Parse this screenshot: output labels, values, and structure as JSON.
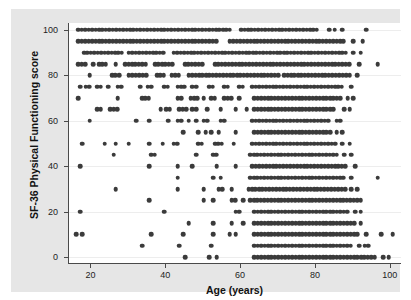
{
  "chart_data": {
    "type": "scatter",
    "title": "",
    "subtitle": "",
    "xlabel": "Age (years)",
    "ylabel": "SF-36 Physical Functioning score",
    "xlim": [
      14,
      103
    ],
    "ylim": [
      -3,
      103
    ],
    "xticks": [
      20,
      40,
      60,
      80,
      100
    ],
    "yticks": [
      0,
      20,
      40,
      60,
      80,
      100
    ],
    "xtick_labels": [
      "20",
      "40",
      "60",
      "80",
      "100"
    ],
    "ytick_labels": [
      "0",
      "20",
      "40",
      "60",
      "80",
      "100"
    ],
    "grid": "horizontal-faint",
    "legend": "none",
    "marker": {
      "shape": "circle",
      "color": "#3b3b3b",
      "size_px": 4.6
    },
    "panel_background": "#ffffff",
    "figure_background": "#e6e6e6",
    "axis_color": "#4a4a4a",
    "series": [
      {
        "name": "participants",
        "score_step": 5,
        "bands": [
          {
            "score": 100,
            "runs": [
              [
                16.5,
                57.5
              ],
              [
                60.0,
                80.5
              ]
            ],
            "singles": [
              83.5,
              85.0,
              87.0,
              93.5
            ]
          },
          {
            "score": 95,
            "runs": [
              [
                16.5,
                54.0
              ],
              [
                57.0,
                88.0
              ]
            ],
            "singles": [
              90.0,
              92.5
            ]
          },
          {
            "score": 90,
            "runs": [
              [
                18.0,
                28.5
              ],
              [
                30.0,
                40.0
              ],
              [
                42.0,
                88.0
              ]
            ],
            "singles": [
              90.0,
              92.0
            ]
          },
          {
            "score": 85,
            "runs": [
              [
                16.5,
                19.0
              ],
              [
                22.0,
                24.5
              ],
              [
                29.0,
                35.0
              ],
              [
                37.0,
                42.0
              ],
              [
                45.0,
                50.5
              ],
              [
                53.0,
                89.5
              ]
            ],
            "singles": [
              20.5,
              26.5,
              91.5,
              96.5
            ]
          },
          {
            "score": 80,
            "runs": [
              [
                25.5,
                28.0
              ],
              [
                30.0,
                35.5
              ],
              [
                37.5,
                39.5
              ],
              [
                41.5,
                43.5
              ],
              [
                46.0,
                70.0
              ],
              [
                71.5,
                89.0
              ]
            ],
            "singles": [
              19.5,
              91.0
            ]
          },
          {
            "score": 75,
            "runs": [
              [
                18.5,
                19.5
              ],
              [
                21.5,
                22.5
              ],
              [
                27.0,
                28.0
              ],
              [
                35.0,
                36.5
              ],
              [
                39.5,
                41.0
              ],
              [
                43.0,
                45.0
              ],
              [
                47.0,
                48.5
              ],
              [
                51.5,
                53.0
              ],
              [
                55.5,
                57.0
              ],
              [
                59.5,
                61.0
              ],
              [
                63.0,
                87.5
              ]
            ],
            "singles": [
              17.0,
              24.5,
              33.0,
              89.5
            ]
          },
          {
            "score": 70,
            "runs": [
              [
                33.5,
                35.5
              ],
              [
                43.0,
                44.0
              ],
              [
                46.5,
                48.5
              ],
              [
                52.0,
                53.0
              ],
              [
                55.5,
                57.5
              ],
              [
                63.5,
                87.0
              ]
            ],
            "singles": [
              16.5,
              27.0,
              50.0,
              59.5,
              88.5,
              90.0
            ]
          },
          {
            "score": 65,
            "runs": [
              [
                21.5,
                23.0
              ],
              [
                25.0,
                27.5
              ],
              [
                40.0,
                41.5
              ],
              [
                43.5,
                45.5
              ],
              [
                47.0,
                48.0
              ],
              [
                63.5,
                85.5
              ]
            ],
            "singles": [
              38.5,
              51.0,
              54.5,
              58.5,
              61.5,
              87.5,
              89.0
            ]
          },
          {
            "score": 60,
            "runs": [
              [
                43.0,
                44.0
              ],
              [
                50.0,
                51.5
              ],
              [
                54.5,
                56.0
              ],
              [
                63.0,
                83.5
              ]
            ],
            "singles": [
              19.5,
              32.0,
              35.5,
              40.5,
              46.0,
              48.0,
              85.5,
              86.5
            ]
          },
          {
            "score": 55,
            "runs": [
              [
                63.5,
                84.0
              ]
            ],
            "singles": [
              44.5,
              48.5,
              50.5,
              52.0,
              54.0,
              58.5,
              85.5,
              87.0
            ]
          },
          {
            "score": 50,
            "runs": [
              [
                42.0,
                43.5
              ],
              [
                48.5,
                50.0
              ],
              [
                53.0,
                55.0
              ],
              [
                63.0,
                85.5
              ]
            ],
            "singles": [
              17.5,
              23.5,
              26.5,
              30.0,
              35.5,
              39.0,
              58.0,
              87.0,
              89.0
            ]
          },
          {
            "score": 45,
            "runs": [
              [
                36.0,
                37.5
              ],
              [
                52.5,
                54.0
              ],
              [
                62.5,
                86.0
              ]
            ],
            "singles": [
              26.0,
              48.0,
              87.5,
              89.5
            ]
          },
          {
            "score": 40,
            "runs": [
              [
                63.0,
                88.5
              ]
            ],
            "singles": [
              17.0,
              35.5,
              43.0,
              47.0,
              53.5,
              58.5,
              90.5
            ]
          },
          {
            "score": 35,
            "runs": [
              [
                62.5,
                87.5
              ]
            ],
            "singles": [
              43.0,
              52.5,
              54.5,
              89.5,
              96.5
            ]
          },
          {
            "score": 30,
            "runs": [
              [
                54.0,
                55.5
              ],
              [
                62.0,
                88.0
              ]
            ],
            "singles": [
              26.5,
              43.0,
              50.0,
              57.5,
              89.5,
              91.0
            ]
          },
          {
            "score": 25,
            "runs": [
              [
                57.5,
                59.0
              ],
              [
                62.5,
                92.0
              ]
            ],
            "singles": [
              35.5,
              50.0,
              52.5,
              60.5
            ]
          },
          {
            "score": 20,
            "runs": [
              [
                58.5,
                60.0
              ],
              [
                63.5,
                89.0
              ]
            ],
            "singles": [
              17.0,
              39.5,
              90.5,
              92.0
            ]
          },
          {
            "score": 15,
            "runs": [
              [
                63.5,
                90.5
              ]
            ],
            "singles": [
              46.0,
              52.5,
              57.5,
              60.5,
              92.0
            ]
          },
          {
            "score": 10,
            "runs": [
              [
                63.5,
                91.5
              ]
            ],
            "singles": [
              16.0,
              17.5,
              36.0,
              44.5,
              52.5,
              57.0,
              58.5,
              93.5,
              97.5,
              100.5
            ]
          },
          {
            "score": 5,
            "runs": [
              [
                63.5,
                90.0
              ]
            ],
            "singles": [
              33.5,
              43.5,
              52.0,
              91.5,
              93.0,
              94.0
            ]
          },
          {
            "score": 0,
            "runs": [
              [
                63.5,
                96.5
              ]
            ],
            "singles": [
              45.0,
              51.5,
              53.5,
              98.0,
              99.5
            ]
          }
        ]
      }
    ]
  },
  "axes": {
    "x_title": "Age (years)",
    "y_title": "SF-36 Physical Functioning score"
  }
}
